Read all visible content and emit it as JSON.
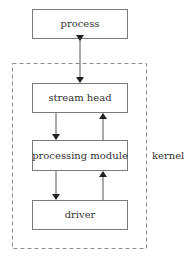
{
  "diagram": {
    "nodes": [
      {
        "id": "process",
        "label": "process"
      },
      {
        "id": "stream_head",
        "label": "stream head"
      },
      {
        "id": "processing_module",
        "label": "processing module"
      },
      {
        "id": "driver",
        "label": "driver"
      }
    ],
    "region": {
      "label": "kernel"
    },
    "edges": [
      {
        "from": "process",
        "to": "stream_head",
        "type": "bidirectional"
      },
      {
        "from": "stream_head",
        "to": "processing_module",
        "type": "down"
      },
      {
        "from": "processing_module",
        "to": "stream_head",
        "type": "up"
      },
      {
        "from": "processing_module",
        "to": "driver",
        "type": "down"
      },
      {
        "from": "driver",
        "to": "processing_module",
        "type": "up"
      }
    ],
    "colors": {
      "stroke": "#7a7a7a",
      "text": "#333333",
      "background": "#ffffff"
    }
  }
}
